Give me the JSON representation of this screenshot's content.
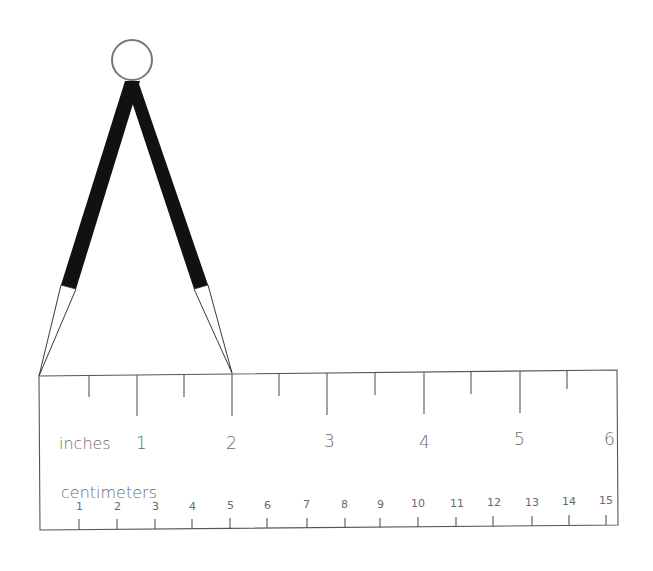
{
  "diagram": {
    "compass": {
      "ring": {
        "cx": 132,
        "cy": 60,
        "r": 20
      },
      "left_leg_tip": {
        "x": 39,
        "y": 376
      },
      "right_leg_tip": {
        "x": 232,
        "y": 373
      },
      "span_inches": 2,
      "span_cm": 5.08
    },
    "ruler": {
      "inches_label": "inches",
      "centimeters_label": "centimeters",
      "inch_labels": [
        "1",
        "2",
        "3",
        "4",
        "5",
        "6"
      ],
      "cm_labels": [
        "1",
        "2",
        "3",
        "4",
        "5",
        "6",
        "7",
        "8",
        "9",
        "10",
        "11",
        "12",
        "13",
        "14",
        "15"
      ],
      "inch_ticks": "every 1/2 inch, long at whole inches",
      "length_inches": 6,
      "length_cm": 15
    },
    "colors": {
      "ink": "#111111",
      "line": "#555555",
      "label": "#6a6a6a",
      "background": "#ffffff"
    }
  }
}
